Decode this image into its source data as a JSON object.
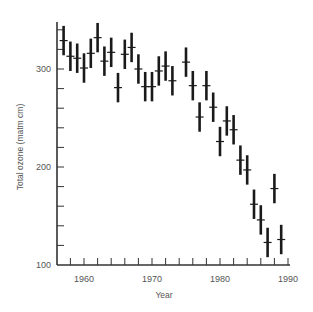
{
  "chart_data": {
    "type": "scatter",
    "title": "",
    "xlabel": "Year",
    "ylabel": "Total ozone (matm cm)",
    "xlim": [
      1956,
      1991
    ],
    "ylim": [
      100,
      350
    ],
    "x_ticks": [
      1960,
      1970,
      1980,
      1990
    ],
    "x_minor_tick_step": 2,
    "y_ticks": [
      100,
      200,
      300
    ],
    "y_minor_tick_step": 20,
    "grid": false,
    "legend": null,
    "error_bar_half_range": 15,
    "series": [
      {
        "name": "Total ozone",
        "x": [
          1957,
          1958,
          1959,
          1960,
          1961,
          1962,
          1963,
          1964,
          1965,
          1966,
          1967,
          1968,
          1969,
          1970,
          1971,
          1972,
          1973,
          1975,
          1976,
          1977,
          1978,
          1979,
          1980,
          1981,
          1982,
          1983,
          1984,
          1985,
          1986,
          1987,
          1988,
          1989
        ],
        "values": [
          329,
          313,
          311,
          301,
          316,
          332,
          308,
          317,
          281,
          315,
          322,
          300,
          282,
          282,
          298,
          303,
          288,
          307,
          283,
          251,
          283,
          261,
          226,
          247,
          238,
          207,
          197,
          162,
          146,
          123,
          178,
          126
        ]
      }
    ]
  }
}
